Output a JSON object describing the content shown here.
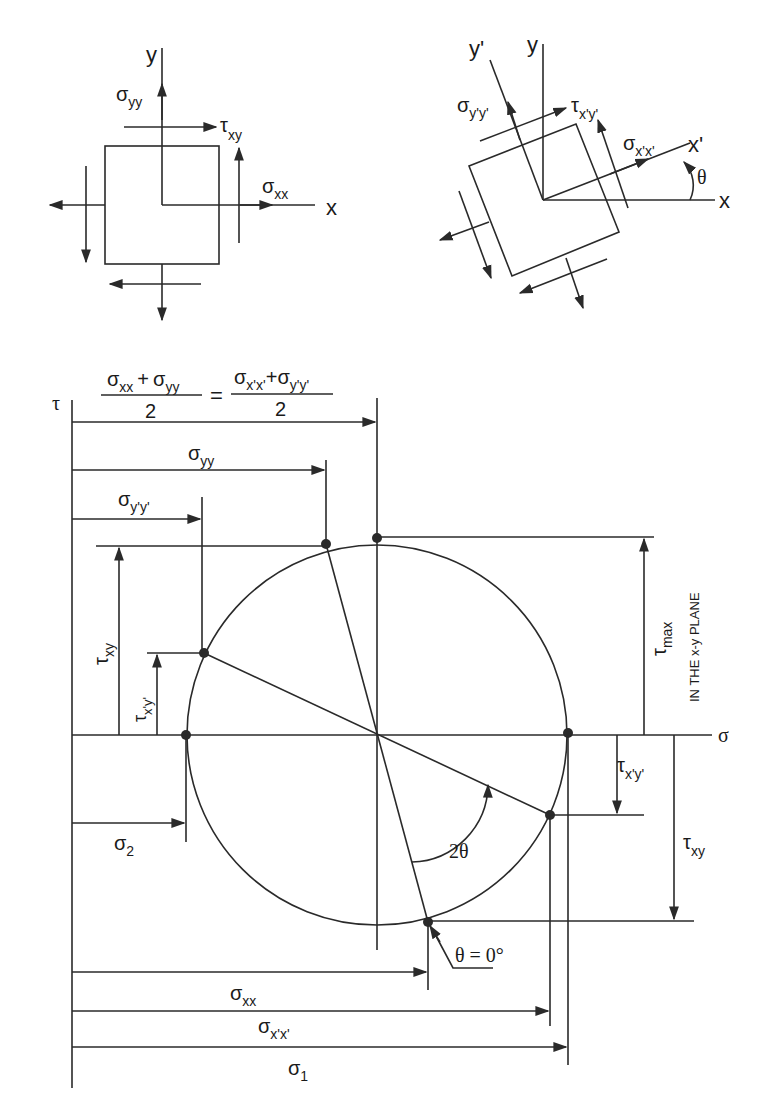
{
  "figure": {
    "element_unrotated": {
      "axis_x": "x",
      "axis_y": "y",
      "normal_x": {
        "sym": "σ",
        "sub": "xx"
      },
      "normal_y": {
        "sym": "σ",
        "sub": "yy"
      },
      "shear": {
        "sym": "τ",
        "sub": "xy"
      }
    },
    "element_rotated": {
      "axis_x": "x",
      "axis_y": "y",
      "axis_xp": "x'",
      "axis_yp": "y'",
      "angle": "θ",
      "normal_xp": {
        "sym": "σ",
        "sub": "x'x'"
      },
      "normal_yp": {
        "sym": "σ",
        "sub": "y'y'"
      },
      "shear_p": {
        "sym": "τ",
        "sub": "x'y'"
      }
    },
    "mohr": {
      "tau_axis": "τ",
      "sigma_axis": "σ",
      "center_formula": {
        "lhs_num_a": {
          "sym": "σ",
          "sub": "xx"
        },
        "plus": "+",
        "lhs_num_b": {
          "sym": "σ",
          "sub": "yy"
        },
        "den": "2",
        "equals": "=",
        "rhs_num_a": {
          "sym": "σ",
          "sub": "x'x'"
        },
        "rhs_num_b": {
          "sym": "σ",
          "sub": "y'y'"
        }
      },
      "dim_sigma_yy": {
        "sym": "σ",
        "sub": "yy"
      },
      "dim_sigma_ypyp": {
        "sym": "σ",
        "sub": "y'y'"
      },
      "dim_tau_xy_left": {
        "sym": "τ",
        "sub": "xy"
      },
      "dim_tau_xpyp_left": {
        "sym": "τ",
        "sub": "x'y'"
      },
      "dim_sigma_2": {
        "sym": "σ",
        "sub": "2"
      },
      "dim_tau_max": {
        "sym": "τ",
        "sub": "max"
      },
      "tau_max_note": "IN THE x-y PLANE",
      "dim_tau_xpyp_right": {
        "sym": "τ",
        "sub": "x'y'"
      },
      "dim_tau_xy_right": {
        "sym": "τ",
        "sub": "xy"
      },
      "angle_2theta": "2θ",
      "theta_zero": "θ = 0°",
      "dim_sigma_xx": {
        "sym": "σ",
        "sub": "xx"
      },
      "dim_sigma_xpxp": {
        "sym": "σ",
        "sub": "x'x'"
      },
      "dim_sigma_1": {
        "sym": "σ",
        "sub": "1"
      }
    }
  }
}
